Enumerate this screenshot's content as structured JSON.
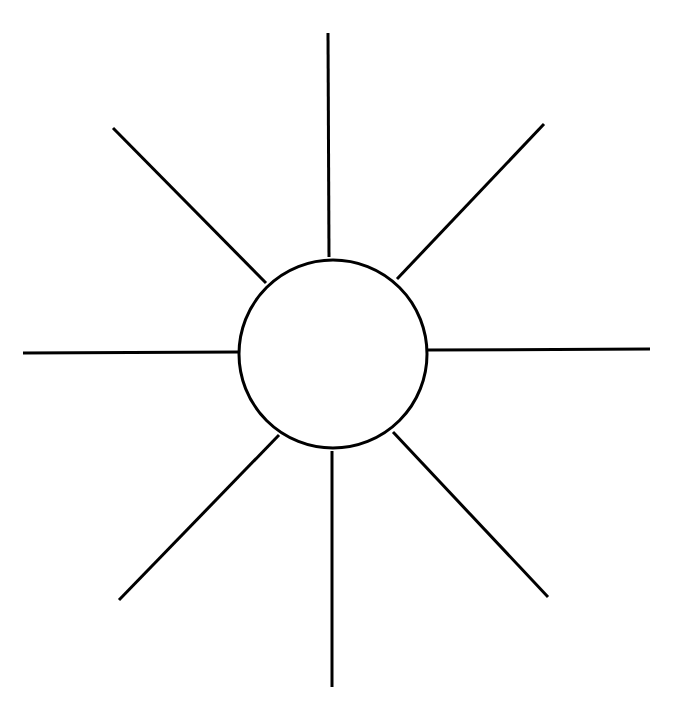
{
  "caption": {
    "text": "",
    "note": "Top text line is cut off; only descenders visible"
  },
  "diagram": {
    "type": "web-organizer",
    "stroke_color": "#000000",
    "stroke_width": 3,
    "center_circle": {
      "cx": 333,
      "cy": 354,
      "r": 94,
      "label": ""
    },
    "spokes": [
      {
        "name": "spoke-top",
        "x1": 328,
        "y1": 33,
        "x2": 329,
        "y2": 257
      },
      {
        "name": "spoke-top-right",
        "x1": 544,
        "y1": 124,
        "x2": 397,
        "y2": 279
      },
      {
        "name": "spoke-right",
        "x1": 650,
        "y1": 349,
        "x2": 427,
        "y2": 350
      },
      {
        "name": "spoke-bottom-right",
        "x1": 548,
        "y1": 597,
        "x2": 393,
        "y2": 432
      },
      {
        "name": "spoke-bottom",
        "x1": 332,
        "y1": 687,
        "x2": 332,
        "y2": 451
      },
      {
        "name": "spoke-bottom-left",
        "x1": 119,
        "y1": 600,
        "x2": 279,
        "y2": 435
      },
      {
        "name": "spoke-left",
        "x1": 23,
        "y1": 353,
        "x2": 239,
        "y2": 352
      },
      {
        "name": "spoke-top-left",
        "x1": 113,
        "y1": 128,
        "x2": 266,
        "y2": 283
      }
    ]
  }
}
